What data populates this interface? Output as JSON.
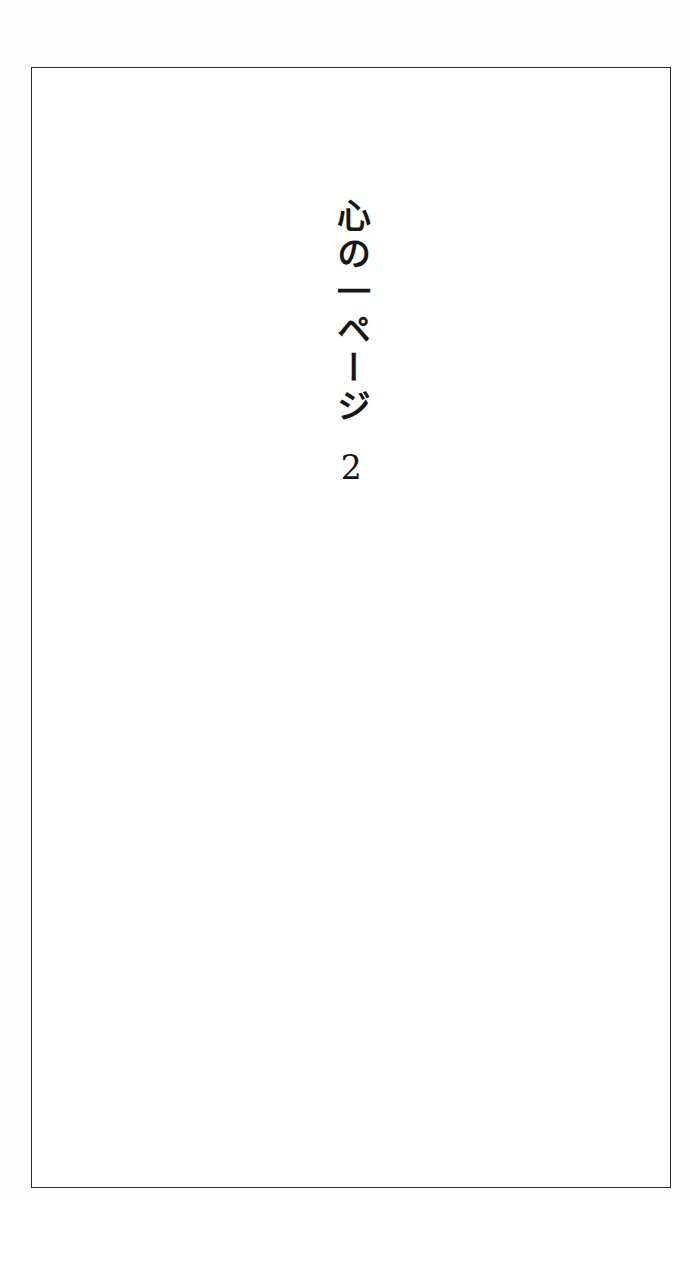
{
  "page": {
    "background_color": "#ffffff",
    "frame_color": "#2b2b2d",
    "text_color": "#16161a",
    "orientation": "vertical-rl"
  },
  "title": {
    "text": "心の一ページ",
    "romanization": "Kokoro no Ichi Peeji",
    "characters": [
      "心",
      "の",
      "一",
      "ペ",
      "ー",
      "ジ"
    ]
  },
  "volume": {
    "number": "2"
  }
}
